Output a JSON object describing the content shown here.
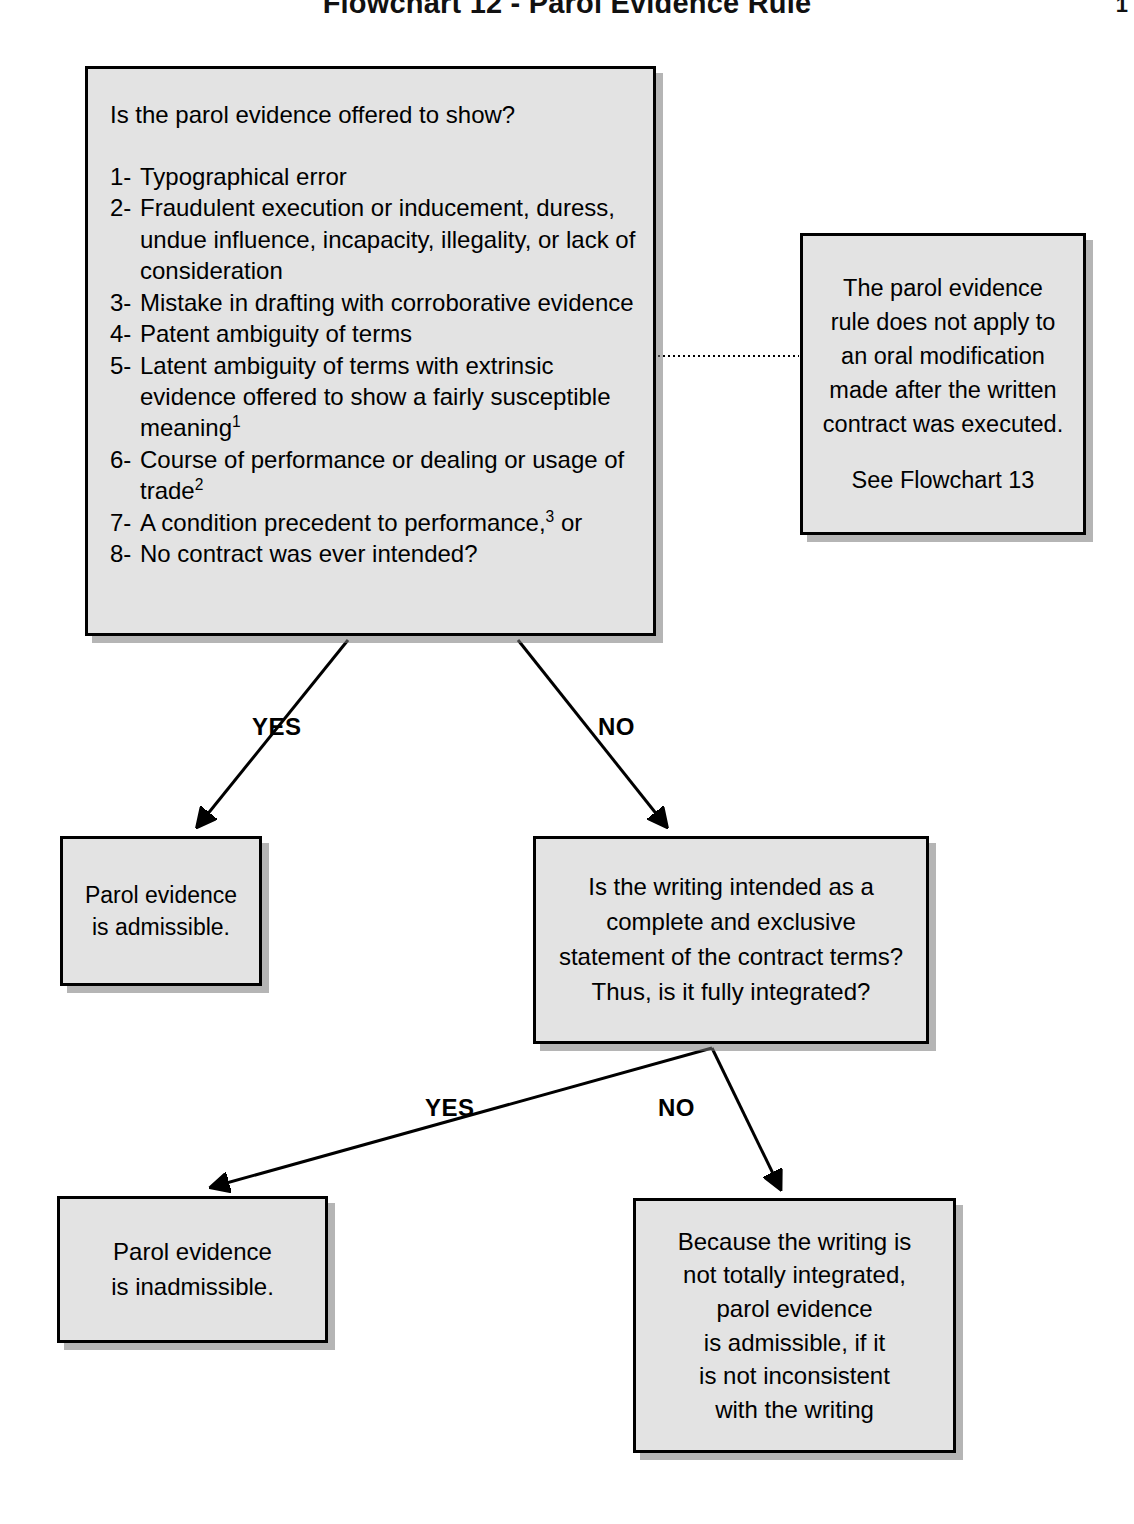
{
  "header": {
    "title": "Flowchart 12 - Parol Evidence Rule",
    "page_number": "1"
  },
  "nodes": {
    "question": {
      "prompt": "Is the parol evidence offered to show?",
      "items": [
        {
          "num": "1-",
          "text": "Typographical error"
        },
        {
          "num": "2-",
          "text": "Fraudulent execution or inducement, duress, undue influence, incapacity, illegality, or lack of consideration"
        },
        {
          "num": "3-",
          "text": "Mistake in drafting with corroborative evidence"
        },
        {
          "num": "4-",
          "text": "Patent ambiguity of terms"
        },
        {
          "num": "5-",
          "text": "Latent ambiguity of terms with extrinsic evidence offered to show a fairly susceptible meaning",
          "sup": "1"
        },
        {
          "num": "6-",
          "text": "Course of performance or dealing or usage of trade",
          "sup": "2"
        },
        {
          "num": "7-",
          "text": "A condition precedent to performance,",
          "sup": "3",
          "tail": " or"
        },
        {
          "num": "8-",
          "text": "No contract was ever intended?"
        }
      ]
    },
    "note": {
      "lines": [
        "The parol evidence",
        "rule does not apply to",
        "an oral modification",
        "made after the written",
        "contract was executed."
      ],
      "reference": "See Flowchart 13"
    },
    "admissible": {
      "lines": [
        "Parol evidence",
        "is admissible."
      ]
    },
    "integration": {
      "lines": [
        "Is the writing intended as a",
        "complete and exclusive",
        "statement of the contract terms?",
        "Thus, is it fully integrated?"
      ]
    },
    "inadmissible": {
      "lines": [
        "Parol evidence",
        "is inadmissible."
      ]
    },
    "partial": {
      "lines": [
        "Because the writing is",
        "not totally integrated,",
        "parol evidence",
        "is admissible, if it",
        "is not inconsistent",
        "with the writing"
      ]
    }
  },
  "edges": {
    "yes_1": "YES",
    "no_1": "NO",
    "yes_2": "YES",
    "no_2": "NO"
  },
  "colors": {
    "box_fill": "#e3e3e3",
    "box_border": "#000000",
    "page_background": "#ffffff",
    "text": "#000000",
    "shadow": "#787878"
  }
}
